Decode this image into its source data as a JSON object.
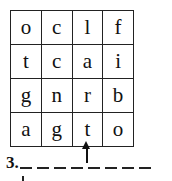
{
  "puzzle": {
    "grid": [
      [
        "o",
        "c",
        "l",
        "f"
      ],
      [
        "t",
        "c",
        "a",
        "i"
      ],
      [
        "g",
        "n",
        "r",
        "b"
      ],
      [
        "a",
        "g",
        "t",
        "o"
      ]
    ],
    "start_arrow_column": 3,
    "question_number": "3.",
    "blank_count": 8
  }
}
